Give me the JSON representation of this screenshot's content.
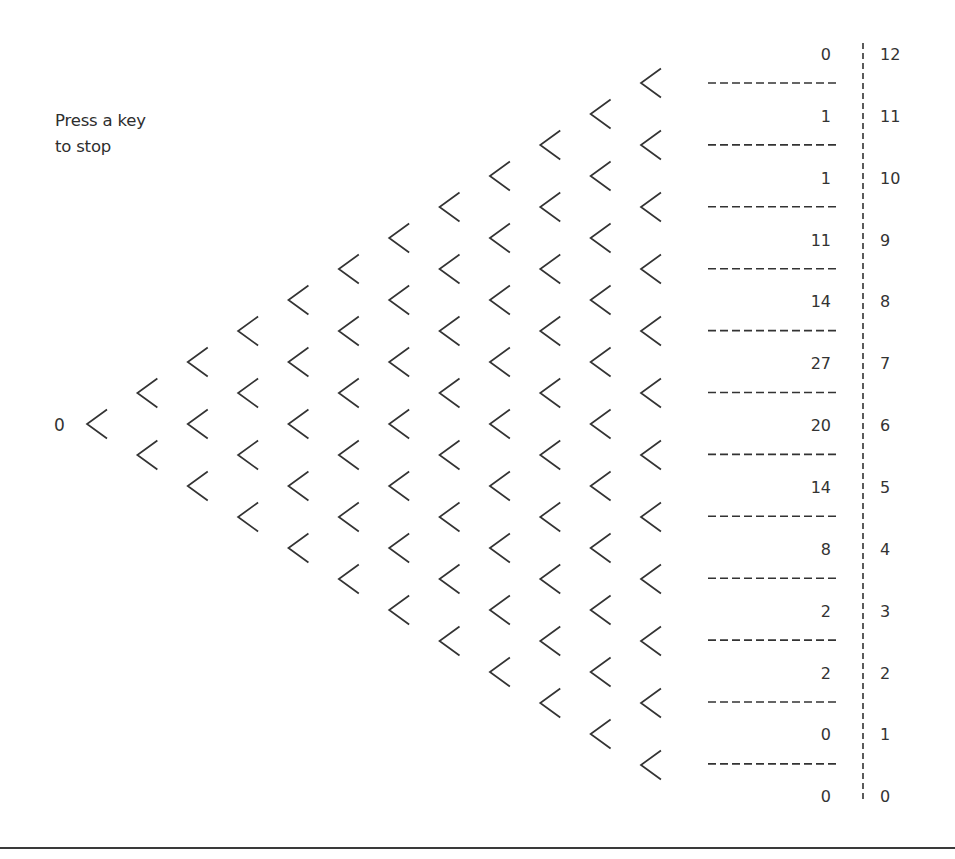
{
  "instructions": {
    "line1": "Press a key",
    "line2": "to stop"
  },
  "start_label": "0",
  "board": {
    "levels": 12,
    "peg_glyph": "chevron-left",
    "colors": {
      "stroke": "#333333",
      "background": "#ffffff",
      "rule": "#3a3a3a"
    }
  },
  "bins": [
    {
      "bin": "12",
      "count": "0"
    },
    {
      "bin": "11",
      "count": "1"
    },
    {
      "bin": "10",
      "count": "1"
    },
    {
      "bin": "9",
      "count": "11"
    },
    {
      "bin": "8",
      "count": "14"
    },
    {
      "bin": "7",
      "count": "27"
    },
    {
      "bin": "6",
      "count": "20"
    },
    {
      "bin": "5",
      "count": "14"
    },
    {
      "bin": "4",
      "count": "8"
    },
    {
      "bin": "3",
      "count": "2"
    },
    {
      "bin": "2",
      "count": "2"
    },
    {
      "bin": "1",
      "count": "0"
    },
    {
      "bin": "0",
      "count": "0"
    }
  ]
}
